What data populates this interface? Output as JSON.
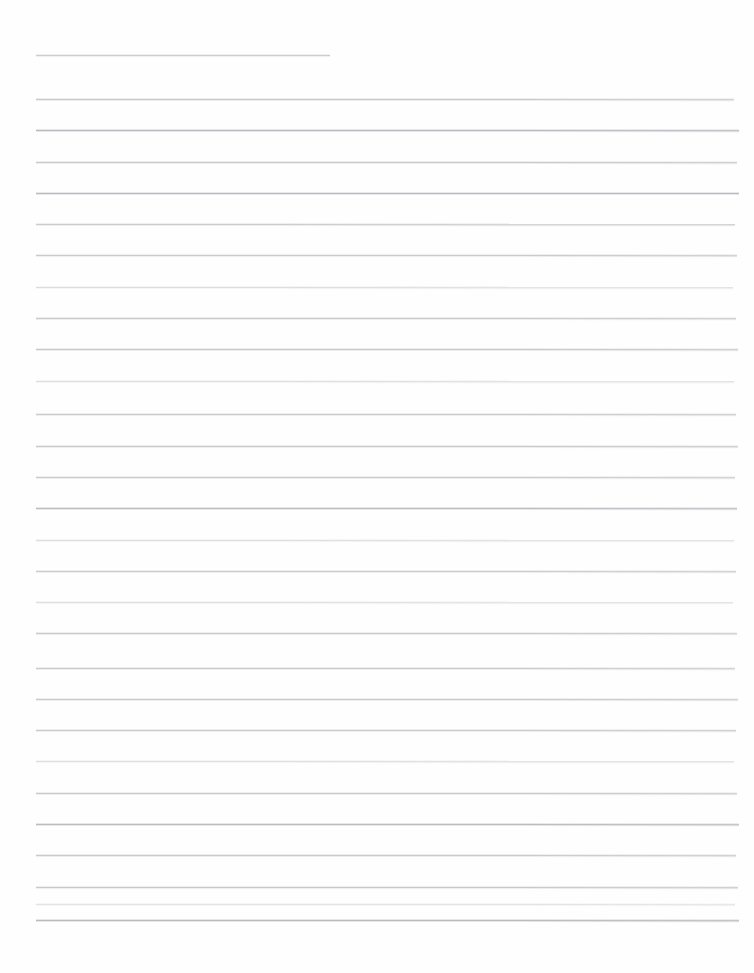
{
  "document": {
    "kind": "scanned-lined-paper",
    "title": "Blank ruled notebook page",
    "page_width": 754,
    "page_height": 973,
    "background_color": "#fefefe",
    "rule_color": "#c5c7cb",
    "has_text_content": false,
    "has_margin_rule": false,
    "body_text": "",
    "line_count": 29,
    "line_spacing": 30.9,
    "first_line_y": 55,
    "last_line_y": 920,
    "default_line_left": 36,
    "default_line_right": 734,
    "bottom_margin": 53
  },
  "lines": [
    {
      "index": 1,
      "y": 55,
      "left": 36,
      "right": 330,
      "weight": "normal",
      "slant": 0.3,
      "opacity": 0.88
    },
    {
      "index": 2,
      "y": 99,
      "left": 36,
      "right": 734,
      "weight": "normal",
      "slant": 0.22,
      "opacity": 0.92
    },
    {
      "index": 3,
      "y": 130,
      "left": 36,
      "right": 739,
      "weight": "dark",
      "slant": 0.18,
      "opacity": 1.0
    },
    {
      "index": 4,
      "y": 162,
      "left": 36,
      "right": 737,
      "weight": "normal",
      "slant": 0.24,
      "opacity": 0.94
    },
    {
      "index": 5,
      "y": 193,
      "left": 36,
      "right": 739,
      "weight": "dark",
      "slant": 0.16,
      "opacity": 0.98
    },
    {
      "index": 6,
      "y": 224,
      "left": 36,
      "right": 735,
      "weight": "normal",
      "slant": 0.26,
      "opacity": 0.9
    },
    {
      "index": 7,
      "y": 255,
      "left": 36,
      "right": 737,
      "weight": "normal",
      "slant": 0.2,
      "opacity": 0.93
    },
    {
      "index": 8,
      "y": 287,
      "left": 36,
      "right": 733,
      "weight": "faint",
      "slant": 0.28,
      "opacity": 0.85
    },
    {
      "index": 9,
      "y": 318,
      "left": 36,
      "right": 736,
      "weight": "normal",
      "slant": 0.22,
      "opacity": 0.92
    },
    {
      "index": 10,
      "y": 349,
      "left": 36,
      "right": 738,
      "weight": "normal",
      "slant": 0.18,
      "opacity": 0.95
    },
    {
      "index": 11,
      "y": 381,
      "left": 36,
      "right": 734,
      "weight": "faint",
      "slant": 0.26,
      "opacity": 0.84
    },
    {
      "index": 12,
      "y": 414,
      "left": 36,
      "right": 736,
      "weight": "normal",
      "slant": 0.2,
      "opacity": 0.91
    },
    {
      "index": 13,
      "y": 446,
      "left": 36,
      "right": 738,
      "weight": "normal",
      "slant": 0.24,
      "opacity": 0.94
    },
    {
      "index": 14,
      "y": 477,
      "left": 36,
      "right": 735,
      "weight": "normal",
      "slant": 0.18,
      "opacity": 0.9
    },
    {
      "index": 15,
      "y": 508,
      "left": 36,
      "right": 737,
      "weight": "dark",
      "slant": 0.22,
      "opacity": 0.97
    },
    {
      "index": 16,
      "y": 540,
      "left": 36,
      "right": 734,
      "weight": "faint",
      "slant": 0.28,
      "opacity": 0.82
    },
    {
      "index": 17,
      "y": 571,
      "left": 36,
      "right": 736,
      "weight": "normal",
      "slant": 0.2,
      "opacity": 0.89
    },
    {
      "index": 18,
      "y": 602,
      "left": 36,
      "right": 733,
      "weight": "faint",
      "slant": 0.26,
      "opacity": 0.8
    },
    {
      "index": 19,
      "y": 633,
      "left": 36,
      "right": 737,
      "weight": "normal",
      "slant": 0.18,
      "opacity": 0.92
    },
    {
      "index": 20,
      "y": 668,
      "left": 36,
      "right": 735,
      "weight": "normal",
      "slant": 0.22,
      "opacity": 0.9
    },
    {
      "index": 21,
      "y": 699,
      "left": 36,
      "right": 738,
      "weight": "normal",
      "slant": 0.2,
      "opacity": 0.93
    },
    {
      "index": 22,
      "y": 730,
      "left": 36,
      "right": 736,
      "weight": "normal",
      "slant": 0.24,
      "opacity": 0.91
    },
    {
      "index": 23,
      "y": 761,
      "left": 36,
      "right": 734,
      "weight": "faint",
      "slant": 0.26,
      "opacity": 0.84
    },
    {
      "index": 24,
      "y": 793,
      "left": 36,
      "right": 737,
      "weight": "normal",
      "slant": 0.18,
      "opacity": 0.93
    },
    {
      "index": 25,
      "y": 824,
      "left": 36,
      "right": 739,
      "weight": "dark",
      "slant": 0.2,
      "opacity": 0.98
    },
    {
      "index": 26,
      "y": 855,
      "left": 36,
      "right": 736,
      "weight": "normal",
      "slant": 0.22,
      "opacity": 0.92
    },
    {
      "index": 27,
      "y": 887,
      "left": 36,
      "right": 738,
      "weight": "normal",
      "slant": 0.18,
      "opacity": 0.94
    },
    {
      "index": 28,
      "y": 904,
      "left": 36,
      "right": 735,
      "weight": "faint",
      "slant": 0.24,
      "opacity": 0.7
    },
    {
      "index": 29,
      "y": 920,
      "left": 36,
      "right": 739,
      "weight": "dark",
      "slant": 0.2,
      "opacity": 0.99
    }
  ]
}
